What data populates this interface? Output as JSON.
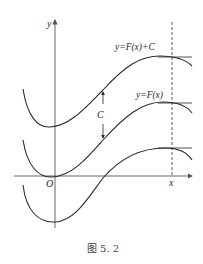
{
  "figure": {
    "caption": "图 5. 2",
    "labels": {
      "y_axis": "y",
      "x_axis": "x",
      "origin": "O",
      "upper_curve": "y=F(x)+C",
      "middle_curve": "y=F(x)",
      "shift": "C"
    },
    "colors": {
      "stroke": "#2a2a2a",
      "axis": "#555555",
      "background": "#ffffff"
    }
  }
}
